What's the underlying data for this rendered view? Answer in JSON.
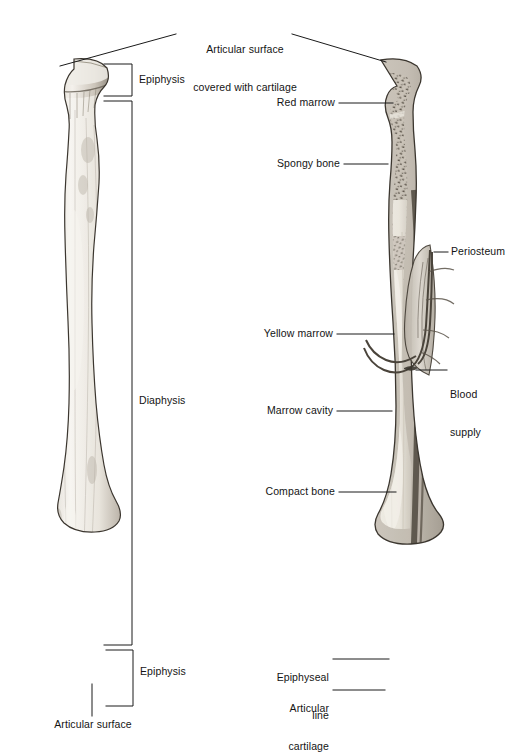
{
  "figure": {
    "views": [
      {
        "name": "external-view",
        "side": "left",
        "description": "Whole long bone, external surface"
      },
      {
        "name": "sectioned-view",
        "side": "right",
        "description": "Long bone cut longitudinally showing internal structure"
      }
    ]
  },
  "colors": {
    "line": "#1a1a1a",
    "text": "#141414",
    "bone_light": "#f2efe9",
    "bone_mid": "#cfc9bf",
    "bone_dark": "#8e877c",
    "cortex": "#6e675c",
    "spongy": "#9c958a",
    "marrow_yellow": "#e6e1d6",
    "background": "#ffffff"
  },
  "labels": {
    "top": {
      "line1": "Articular surface",
      "line2": "covered with cartilage"
    },
    "left_view": [
      {
        "id": "epiphysis-proximal",
        "text": "Epiphysis",
        "type": "bracket"
      },
      {
        "id": "diaphysis",
        "text": "Diaphysis",
        "type": "bracket"
      },
      {
        "id": "epiphysis-distal",
        "text": "Epiphysis",
        "type": "bracket"
      },
      {
        "id": "articular-surface",
        "text": "Articular surface",
        "type": "leader"
      }
    ],
    "right_view": [
      {
        "id": "red-marrow",
        "text": "Red marrow",
        "type": "leader-left"
      },
      {
        "id": "spongy-bone",
        "text": "Spongy bone",
        "type": "leader-left"
      },
      {
        "id": "yellow-marrow",
        "text": "Yellow marrow",
        "type": "leader-left"
      },
      {
        "id": "marrow-cavity",
        "text": "Marrow cavity",
        "type": "leader-left"
      },
      {
        "id": "compact-bone",
        "text": "Compact bone",
        "type": "leader-left"
      },
      {
        "id": "periosteum",
        "text": "Periosteum",
        "type": "leader-right"
      },
      {
        "id": "blood-supply",
        "text": "Blood\nsupply",
        "line1": "Blood",
        "line2": "supply",
        "type": "leader-right"
      },
      {
        "id": "epiphyseal-line",
        "text": "Epiphyseal line",
        "line1": "Epiphyseal",
        "line2": "line",
        "type": "leader-left"
      },
      {
        "id": "articular-cartilage",
        "text": "Articular cartilage",
        "line1": "Articular",
        "line2": "cartilage",
        "type": "leader-left"
      }
    ]
  }
}
